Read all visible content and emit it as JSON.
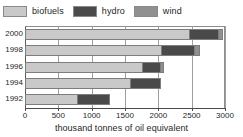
{
  "chart_data": {
    "type": "bar",
    "orientation": "horizontal",
    "stacked": true,
    "title": "",
    "xlabel": "thousand tonnes of oil equivalent",
    "ylabel": "",
    "xlim": [
      0,
      3000
    ],
    "xticks": [
      0,
      500,
      1000,
      1500,
      2000,
      2500,
      3000
    ],
    "xtick_labels": [
      "0",
      "500",
      "1000",
      "1500",
      "2000",
      "2500",
      "3000"
    ],
    "grid": true,
    "legend_position": "top-left",
    "categories": [
      "2000",
      "1998",
      "1996",
      "1994",
      "1992"
    ],
    "series": [
      {
        "name": "biofuels",
        "color": "#c9c9c9",
        "values": [
          2475,
          2055,
          1770,
          1590,
          795
        ]
      },
      {
        "name": "hydro",
        "color": "#4a4a4a",
        "values": [
          435,
          495,
          270,
          450,
          480
        ]
      },
      {
        "name": "wind",
        "color": "#909090",
        "values": [
          60,
          75,
          45,
          0,
          0
        ]
      }
    ],
    "totals": [
      2970,
      2625,
      2085,
      2040,
      1275
    ]
  },
  "legend": {
    "items": [
      {
        "label": "biofuels",
        "swatch_name": "biofuels-swatch"
      },
      {
        "label": "hydro",
        "swatch_name": "hydro-swatch"
      },
      {
        "label": "wind",
        "swatch_name": "wind-swatch"
      }
    ]
  },
  "axis": {
    "x_title": "thousand tonnes of oil equivalent",
    "x_labels": [
      "0",
      "500",
      "1000",
      "1500",
      "2000",
      "2500",
      "3000"
    ],
    "y_labels": [
      "2000",
      "1998",
      "1996",
      "1994",
      "1992"
    ]
  },
  "colors": {
    "biofuels": "#c9c9c9",
    "hydro": "#4a4a4a",
    "wind": "#909090",
    "grid": "#9e9e9e",
    "axis": "#4a4a4a",
    "background": "#ffffff",
    "text": "#1f1f1f"
  }
}
